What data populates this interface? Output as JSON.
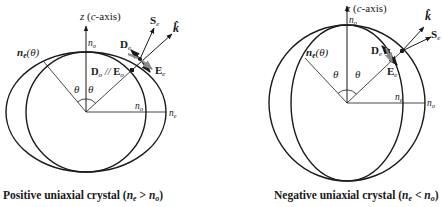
{
  "figure": {
    "left_panel": {
      "title": "Positive uniaxial crystal",
      "caption_condition": "(n_e > n_o)",
      "caption_parts": {
        "prefix": "Positive uniaxial crystal (",
        "ne": "n",
        "ne_sub": "e",
        "op": " > ",
        "no": "n",
        "no_sub": "o",
        "suffix": ")"
      },
      "axis_label": {
        "z": "z",
        "open": " (",
        "c": "c",
        "rest": "-axis)"
      },
      "labels": {
        "n_o_top": {
          "n": "n",
          "sub": "o"
        },
        "n_e_theta": {
          "n": "n",
          "sub": "e",
          "arg": "(θ)"
        },
        "theta_left": "θ",
        "theta_right": "θ",
        "S_e": {
          "main": "S",
          "sub": "e"
        },
        "k_hat": "k̂",
        "D_e": {
          "main": "D",
          "sub": "e"
        },
        "E_e": {
          "main": "E",
          "sub": "e"
        },
        "Do_Eo": {
          "d": "D",
          "dsub": "o",
          "sep": " // ",
          "e": "E",
          "esub": "o"
        },
        "n_o_horiz": {
          "n": "n",
          "sub": "o"
        },
        "n_e_horiz": {
          "n": "n",
          "sub": "e"
        }
      },
      "shapes": {
        "inner": "circle n_o",
        "outer": "ellipse n_e (wider horizontally)"
      }
    },
    "right_panel": {
      "title": "Negative uniaxial crystal",
      "caption_condition": "(n_e < n_o)",
      "caption_parts": {
        "prefix": "Negative uniaxial crystal (",
        "ne": "n",
        "ne_sub": "e",
        "op": " < ",
        "no": "n",
        "no_sub": "o",
        "suffix": ")"
      },
      "axis_label": {
        "z": "z",
        "open": " (",
        "c": "c",
        "rest": "-axis)"
      },
      "labels": {
        "n_o_top": {
          "n": "n",
          "sub": "o"
        },
        "n_e_theta": {
          "n": "n",
          "sub": "e",
          "arg": "(θ)"
        },
        "theta_left": "θ",
        "theta_right": "θ",
        "S_e": {
          "main": "S",
          "sub": "e"
        },
        "k_hat": "k̂",
        "D_e": {
          "main": "D",
          "sub": "e"
        },
        "E_e": {
          "main": "E",
          "sub": "e"
        },
        "n_e_horiz": {
          "n": "n",
          "sub": "e"
        },
        "n_o_horiz": {
          "n": "n",
          "sub": "o"
        }
      },
      "shapes": {
        "outer": "circle n_o",
        "inner": "ellipse n_e (narrower horizontally)"
      }
    },
    "colors": {
      "ink": "#1a1a1a",
      "grey_arrow": "#8a8a8a",
      "background": "#ffffff"
    }
  }
}
